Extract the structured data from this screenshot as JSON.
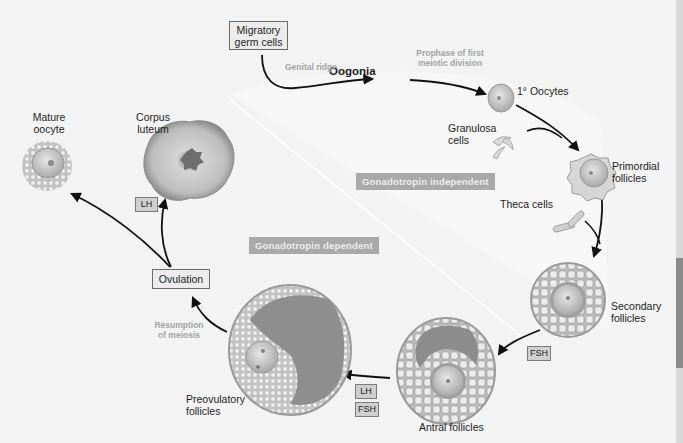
{
  "diagram": {
    "title_implied": "Oogenesis and folliculogenesis",
    "nodes": {
      "migratory_germ_cells": "Migratory germ cells",
      "oogonia": "Oogonia",
      "primary_oocytes": "1° Oocytes",
      "granulosa_cells": "Granulosa cells",
      "primordial_follicles": "Primordial follicles",
      "theca_cells": "Theca cells",
      "secondary_follicles": "Secondary follicles",
      "antral_follicles": "Antral follicles",
      "preovulatory_follicles": "Preovulatory follicles",
      "ovulation": "Ovulation",
      "corpus_luteum": "Corpus luteum",
      "mature_oocyte": "Mature oocyte"
    },
    "labels": {
      "migratory_line1": "Migratory",
      "migratory_line2": "germ cells",
      "granulosa_line1": "Granulosa",
      "granulosa_line2": "cells",
      "primordial_line1": "Primordial",
      "primordial_line2": "follicles",
      "secondary_line1": "Secondary",
      "secondary_line2": "follicles",
      "preovulatory_line1": "Preovulatory",
      "preovulatory_line2": "follicles",
      "corpus_line1": "Corpus",
      "corpus_line2": "luteum",
      "mature_line1": "Mature",
      "mature_line2": "oocyte"
    },
    "process_labels": {
      "genital_ridge": "Genital ridge",
      "prophase_line1": "Prophase of first",
      "prophase_line2": "meiotic division",
      "resumption_line1": "Resumption",
      "resumption_line2": "of meiosis"
    },
    "phases": {
      "independent": "Gonadotropin  independent",
      "dependent": "Gonadotropin dependent"
    },
    "hormones": {
      "fsh_secondary_to_antral": "FSH",
      "lh_antral_to_preovulatory": "LH",
      "fsh_antral_to_preovulatory": "FSH",
      "lh_ovulation_to_corpus": "LH"
    },
    "edges": [
      {
        "from": "Migratory germ cells",
        "to": "Oogonia",
        "label": "Genital ridge"
      },
      {
        "from": "Oogonia",
        "to": "1° Oocytes",
        "label": "Prophase of first meiotic division"
      },
      {
        "from": "1° Oocytes",
        "to": "Primordial follicles",
        "label": ""
      },
      {
        "from": "Granulosa cells",
        "to": "Primordial follicles",
        "label": ""
      },
      {
        "from": "Primordial follicles",
        "to": "Secondary follicles",
        "label": ""
      },
      {
        "from": "Theca cells",
        "to": "Secondary follicles",
        "label": ""
      },
      {
        "from": "Secondary follicles",
        "to": "Antral follicles",
        "label": "FSH"
      },
      {
        "from": "Antral follicles",
        "to": "Preovulatory follicles",
        "label": "LH, FSH"
      },
      {
        "from": "Preovulatory follicles",
        "to": "Ovulation",
        "label": "Resumption of meiosis"
      },
      {
        "from": "Ovulation",
        "to": "Mature oocyte",
        "label": ""
      },
      {
        "from": "Ovulation",
        "to": "Corpus luteum",
        "label": "LH"
      }
    ],
    "colors": {
      "background": "#f3f3f3",
      "phase_band": "#a9a9a9",
      "arrow": "#111111",
      "cell_fill": "#c9c9c9",
      "antrum": "#8f8f8f"
    }
  }
}
